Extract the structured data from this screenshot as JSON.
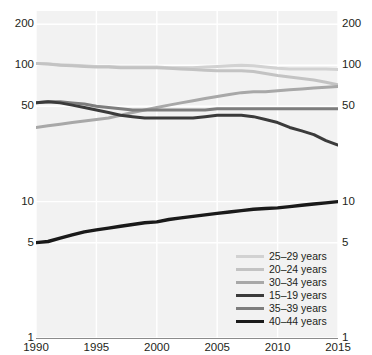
{
  "top_fragment": "",
  "axis": {
    "y_ticks": [
      "200",
      "100",
      "50",
      "10",
      "5",
      "1"
    ],
    "y_tick_values": [
      200,
      100,
      50,
      10,
      5,
      1
    ],
    "x_ticks": [
      "1990",
      "1995",
      "2000",
      "2005",
      "2010",
      "2015"
    ],
    "x_tick_values": [
      1990,
      1995,
      2000,
      2005,
      2010,
      2015
    ],
    "scale": "log"
  },
  "legend": {
    "position": "bottom-right",
    "entries": [
      {
        "label": "25–29 years",
        "color": "#d2d2d2",
        "width": 3.2
      },
      {
        "label": "20–24 years",
        "color": "#c3c3c3",
        "width": 3.2
      },
      {
        "label": "30–34 years",
        "color": "#a8a8a8",
        "width": 3.2
      },
      {
        "label": "15–19 years",
        "color": "#3b3b3b",
        "width": 3.2
      },
      {
        "label": "35–39 years",
        "color": "#7d7d7d",
        "width": 3.2
      },
      {
        "label": "40–44 years",
        "color": "#1a1a1a",
        "width": 3.4
      }
    ]
  },
  "chart_data": {
    "type": "line",
    "title": "",
    "xlabel": "",
    "ylabel": "",
    "yscale": "log",
    "ylim": [
      1,
      250
    ],
    "xlim": [
      1990,
      2015
    ],
    "grid": true,
    "legend_position": "bottom-right",
    "x": [
      1990,
      1991,
      1992,
      1993,
      1994,
      1995,
      1996,
      1997,
      1998,
      1999,
      2000,
      2001,
      2002,
      2003,
      2004,
      2005,
      2006,
      2007,
      2008,
      2009,
      2010,
      2011,
      2012,
      2013,
      2014,
      2015
    ],
    "series": [
      {
        "name": "25–29 years",
        "color": "#d2d2d2",
        "values": [
          103,
          102,
          101,
          100,
          99,
          98,
          98,
          97,
          97,
          97,
          97,
          96,
          96,
          96,
          97,
          98,
          99,
          100,
          99,
          97,
          95,
          94,
          94,
          94,
          94,
          93
        ]
      },
      {
        "name": "20–24 years",
        "color": "#c3c3c3",
        "values": [
          103,
          102,
          100,
          99,
          98,
          97,
          97,
          96,
          96,
          96,
          96,
          95,
          94,
          93,
          92,
          91,
          91,
          91,
          90,
          87,
          84,
          82,
          80,
          78,
          75,
          72
        ]
      },
      {
        "name": "30–34 years",
        "color": "#a8a8a8",
        "values": [
          35,
          36,
          37,
          38,
          39,
          40,
          41,
          43,
          45,
          47,
          49,
          51,
          53,
          55,
          57,
          59,
          61,
          63,
          64,
          64,
          65,
          66,
          67,
          68,
          69,
          70
        ]
      },
      {
        "name": "15–19 years",
        "color": "#3b3b3b",
        "values": [
          53,
          54,
          53,
          51,
          49,
          47,
          45,
          43,
          42,
          41,
          41,
          41,
          41,
          41,
          42,
          43,
          43,
          43,
          42,
          40,
          38,
          35,
          33,
          31,
          28,
          26
        ]
      },
      {
        "name": "35–39 years",
        "color": "#7d7d7d",
        "values": [
          53,
          54,
          54,
          53,
          52,
          50,
          49,
          48,
          47,
          47,
          47,
          47,
          47,
          47,
          47,
          48,
          48,
          48,
          48,
          48,
          48,
          48,
          48,
          48,
          48,
          48
        ]
      },
      {
        "name": "40–44 years",
        "color": "#1a1a1a",
        "values": [
          5.0,
          5.1,
          5.4,
          5.7,
          6.0,
          6.2,
          6.4,
          6.6,
          6.8,
          7.0,
          7.1,
          7.4,
          7.6,
          7.8,
          8.0,
          8.2,
          8.4,
          8.6,
          8.8,
          8.9,
          9.0,
          9.2,
          9.4,
          9.6,
          9.8,
          10.0
        ]
      }
    ]
  }
}
